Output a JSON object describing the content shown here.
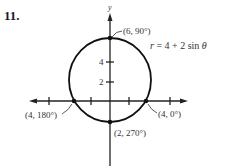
{
  "problem": {
    "number": "11."
  },
  "graph": {
    "equation": "r = 4 + 2 sin θ",
    "equation_parts": {
      "lhs": "r",
      "rhs_a": " = 4 + 2 sin ",
      "theta": "θ"
    },
    "axis_label_y": "y",
    "tick_labels": {
      "y4": "4",
      "y2": "2"
    },
    "points": [
      {
        "id": "p90",
        "label": "(6, 90°)"
      },
      {
        "id": "p0",
        "label": "(4, 0°)"
      },
      {
        "id": "p180",
        "label": "(4, 180°)"
      },
      {
        "id": "p270",
        "label": "(2, 270°)"
      }
    ]
  }
}
